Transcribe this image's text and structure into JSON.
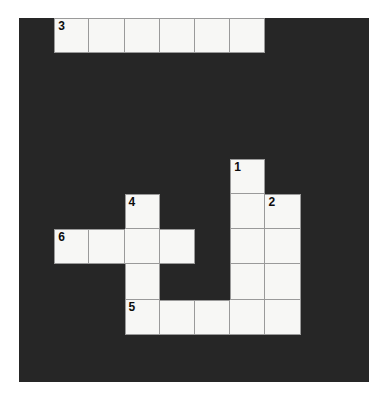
{
  "puzzle": {
    "type": "crossword-grid",
    "columns": 10,
    "rows": 10,
    "cell_size_px": 35.2,
    "colors": {
      "background": "#ffffff",
      "block": "#262626",
      "cell_fill": "#f7f7f5",
      "grid_line": "#9a9a9a",
      "number_text": "#0d0d0d"
    },
    "board_origin": {
      "x": 19,
      "y": 18,
      "width": 350,
      "height": 364
    },
    "clue_numbers": [
      "1",
      "2",
      "3",
      "4",
      "5",
      "6"
    ],
    "cells": [
      {
        "row": 0,
        "col": 1,
        "number": "3"
      },
      {
        "row": 0,
        "col": 2,
        "number": ""
      },
      {
        "row": 0,
        "col": 3,
        "number": ""
      },
      {
        "row": 0,
        "col": 4,
        "number": ""
      },
      {
        "row": 0,
        "col": 5,
        "number": ""
      },
      {
        "row": 0,
        "col": 6,
        "number": ""
      },
      {
        "row": 4,
        "col": 6,
        "number": "1"
      },
      {
        "row": 5,
        "col": 3,
        "number": "4"
      },
      {
        "row": 5,
        "col": 6,
        "number": ""
      },
      {
        "row": 5,
        "col": 7,
        "number": "2"
      },
      {
        "row": 6,
        "col": 1,
        "number": "6"
      },
      {
        "row": 6,
        "col": 2,
        "number": ""
      },
      {
        "row": 6,
        "col": 3,
        "number": ""
      },
      {
        "row": 6,
        "col": 4,
        "number": ""
      },
      {
        "row": 6,
        "col": 6,
        "number": ""
      },
      {
        "row": 6,
        "col": 7,
        "number": ""
      },
      {
        "row": 7,
        "col": 3,
        "number": ""
      },
      {
        "row": 7,
        "col": 6,
        "number": ""
      },
      {
        "row": 7,
        "col": 7,
        "number": ""
      },
      {
        "row": 8,
        "col": 3,
        "number": "5"
      },
      {
        "row": 8,
        "col": 4,
        "number": ""
      },
      {
        "row": 8,
        "col": 5,
        "number": ""
      },
      {
        "row": 8,
        "col": 6,
        "number": ""
      },
      {
        "row": 8,
        "col": 7,
        "number": ""
      }
    ]
  }
}
